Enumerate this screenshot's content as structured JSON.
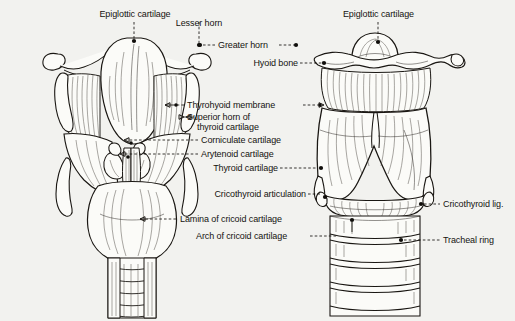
{
  "figure": {
    "background_color": "#f2f2ef",
    "ink_color": "#1a1713",
    "views": [
      {
        "name": "posterior-view",
        "side": "left"
      },
      {
        "name": "anterior-view",
        "side": "right"
      }
    ]
  },
  "labels": {
    "epiglottic_cartilage_left": "Epiglottic cartilage",
    "lesser_horn": "Lesser horn",
    "greater_horn": "Greater horn",
    "hyoid_bone": "Hyoid bone",
    "thyrohyoid_membrane": "Thyrohyoid membrane",
    "superior_horn_line1": "Superior horn of",
    "superior_horn_line2": "thyroid cartilage",
    "corniculate_cartilage": "Corniculate cartilage",
    "arytenoid_cartilage": "Arytenoid cartilage",
    "thyroid_cartilage": "Thyroid cartilage",
    "cricothyroid_articulation": "Cricothyroid articulation",
    "lamina_of_cricoid_cartilage": "Lamina of cricoid cartilage",
    "arch_of_cricoid_cartilage": "Arch of cricoid cartilage",
    "epiglottic_cartilage_right": "Epiglottic cartilage",
    "cricothyroid_lig": "Cricothyroid lig.",
    "tracheal_ring": "Tracheal ring"
  }
}
